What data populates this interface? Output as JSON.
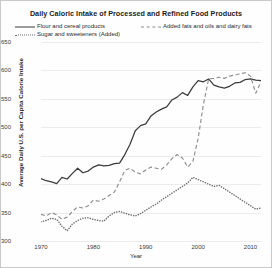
{
  "chart_data": {
    "type": "line",
    "title": "Daily Caloric Intake of Processed and Refined Food Products",
    "xlabel": "Year",
    "ylabel": "Average Daily U.S. per Capita Calorie Intake",
    "xlim": [
      1970,
      2012
    ],
    "ylim": [
      300,
      650
    ],
    "yticks": [
      300,
      350,
      400,
      450,
      500,
      550,
      600,
      650
    ],
    "xticks": [
      1970,
      1980,
      1990,
      2000,
      2010
    ],
    "grid": "horizontal",
    "legend_position": "top",
    "series": [
      {
        "name": "Flour and cereal products",
        "style": "solid",
        "color": "#3b3b3b",
        "x": [
          1970,
          1971,
          1972,
          1973,
          1974,
          1975,
          1976,
          1977,
          1978,
          1979,
          1980,
          1981,
          1982,
          1983,
          1984,
          1985,
          1986,
          1987,
          1988,
          1989,
          1990,
          1991,
          1992,
          1993,
          1994,
          1995,
          1996,
          1997,
          1998,
          1999,
          2000,
          2001,
          2002,
          2003,
          2004,
          2005,
          2006,
          2007,
          2008,
          2009,
          2010,
          2011,
          2012
        ],
        "values": [
          410,
          406,
          404,
          401,
          412,
          409,
          419,
          428,
          420,
          423,
          430,
          434,
          432,
          433,
          436,
          437,
          452,
          470,
          494,
          503,
          506,
          520,
          527,
          532,
          536,
          548,
          553,
          561,
          556,
          571,
          582,
          580,
          585,
          574,
          571,
          569,
          572,
          578,
          579,
          584,
          585,
          583,
          582
        ]
      },
      {
        "name": "Added fats and oils and dairy fats",
        "style": "dashed",
        "color": "#8e8e8e",
        "x": [
          1970,
          1971,
          1972,
          1973,
          1974,
          1975,
          1976,
          1977,
          1978,
          1979,
          1980,
          1981,
          1982,
          1983,
          1984,
          1985,
          1986,
          1987,
          1988,
          1989,
          1990,
          1991,
          1992,
          1993,
          1994,
          1995,
          1996,
          1997,
          1998,
          1999,
          2000,
          2001,
          2002,
          2003,
          2004,
          2005,
          2006,
          2007,
          2008,
          2009,
          2010,
          2011,
          2012
        ],
        "values": [
          347,
          344,
          350,
          346,
          338,
          342,
          352,
          360,
          358,
          362,
          372,
          370,
          374,
          380,
          386,
          404,
          424,
          428,
          421,
          418,
          425,
          430,
          428,
          426,
          434,
          445,
          452,
          446,
          430,
          440,
          480,
          540,
          585,
          586,
          588,
          586,
          590,
          592,
          594,
          596,
          590,
          560,
          580
        ]
      },
      {
        "name": "Sugar and sweeteners (Added)",
        "style": "dotted",
        "color": "#6e6e6e",
        "x": [
          1970,
          1971,
          1972,
          1973,
          1974,
          1975,
          1976,
          1977,
          1978,
          1979,
          1980,
          1981,
          1982,
          1983,
          1984,
          1985,
          1986,
          1987,
          1988,
          1989,
          1990,
          1991,
          1992,
          1993,
          1994,
          1995,
          1996,
          1997,
          1998,
          1999,
          2000,
          2001,
          2002,
          2003,
          2004,
          2005,
          2006,
          2007,
          2008,
          2009,
          2010,
          2011,
          2012
        ],
        "values": [
          334,
          336,
          340,
          338,
          326,
          318,
          330,
          336,
          340,
          341,
          338,
          336,
          335,
          344,
          350,
          352,
          349,
          346,
          344,
          348,
          354,
          360,
          365,
          372,
          378,
          384,
          390,
          396,
          402,
          412,
          408,
          404,
          400,
          396,
          398,
          392,
          386,
          380,
          374,
          368,
          362,
          356,
          358
        ]
      }
    ]
  },
  "legend": {
    "items": [
      {
        "label": "Flour and cereal products",
        "style": "solid"
      },
      {
        "label": "Added fats and oils and dairy fats",
        "style": "dashed"
      },
      {
        "label": "Sugar and sweeteners (Added)",
        "style": "dotted"
      }
    ]
  }
}
